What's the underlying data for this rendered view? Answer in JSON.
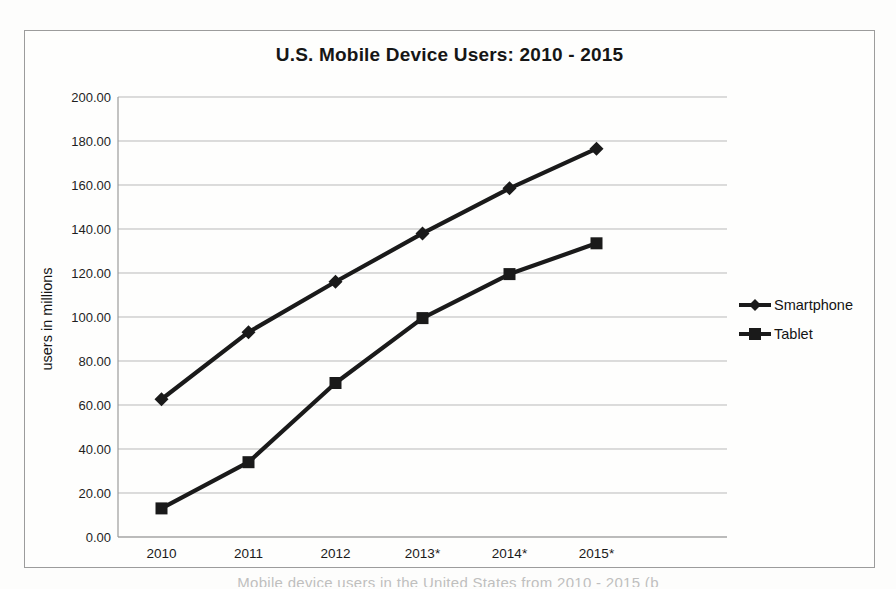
{
  "chart_data": {
    "type": "line",
    "title": "U.S. Mobile Device Users: 2010 - 2015",
    "xlabel": "",
    "ylabel": "users in millions",
    "categories": [
      "2010",
      "2011",
      "2012",
      "2013*",
      "2014*",
      "2015*"
    ],
    "series": [
      {
        "name": "Smartphone",
        "marker": "diamond",
        "values": [
          62.6,
          93.1,
          116.0,
          138.0,
          158.5,
          176.5
        ]
      },
      {
        "name": "Tablet",
        "marker": "square",
        "values": [
          13.0,
          34.0,
          70.0,
          99.5,
          119.5,
          133.5
        ]
      }
    ],
    "ylim": [
      0,
      200
    ],
    "ytick_step": 20,
    "ytick_decimals": 2,
    "grid": true,
    "legend_position": "right",
    "line_color": "#1a1a1a"
  },
  "style": {
    "line_color": "#1a1a1a",
    "grid_color": "#b9b9b9",
    "axis_color": "#9b9b9b",
    "text_color": "#1b1b1b",
    "border_color": "#9c9c9c",
    "background": "#fdfdfc"
  },
  "caption": {
    "text_partial": "Mobile device users in the United States from 2010 - 2015 (b"
  }
}
